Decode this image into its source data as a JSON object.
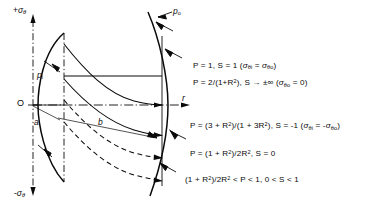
{
  "figure": {
    "type": "engineering-stress-diagram",
    "axes": {
      "y_top_label": "+σθ",
      "y_bottom_label": "-σθ",
      "x_label": "r",
      "origin_label": "O"
    },
    "geometry_labels": {
      "inner_radius": "a",
      "outer_radius": "b",
      "internal_pressure": "p",
      "internal_pressure_sub": "i",
      "external_pressure": "p",
      "external_pressure_sub": "o"
    },
    "annotations": [
      {
        "id": "curve-1",
        "text": "P = 1,  S = 1   (σθi = σθo)",
        "parts": {
          "lead": "P = 1,  S = 1   (",
          "s1": "σ",
          "s1sub": "θi",
          "mid": " = ",
          "s2": "σ",
          "s2sub": "θo",
          "tail": ")"
        }
      },
      {
        "id": "curve-2",
        "text": "P = 2/(1+R²),  S → ±∞   (σθo = 0)",
        "parts": {
          "lead": "P = 2/(1+R",
          "exp": "2",
          "mid": "),  S ",
          "arrow": "→",
          "mid2": " ±∞   (",
          "s1": "σ",
          "s1sub": "θo",
          "tail": " = 0)"
        }
      },
      {
        "id": "curve-3",
        "text": "P = (3+R²)/(1+3R²),  S = -1   (σθi = -σθo)",
        "parts": {
          "lead": "P = (3 + R",
          "exp1": "2",
          "mid": ")/(1 + 3R",
          "exp2": "2",
          "mid2": "),  S = -1   (",
          "s1": "σ",
          "s1sub": "θi",
          "mid3": " = -",
          "s2": "σ",
          "s2sub": "θo",
          "tail": ")"
        }
      },
      {
        "id": "curve-4",
        "text": "P = (1+R²)/2R²,  S = 0",
        "parts": {
          "lead": "P = (1 + R",
          "exp1": "2",
          "mid": ")/2R",
          "exp2": "2",
          "tail": ",  S = 0"
        }
      },
      {
        "id": "curve-5",
        "text": "(1+R²)/2R² < P < 1,  0 < S < 1",
        "parts": {
          "lead": "(1 + R",
          "exp1": "2",
          "mid": ")/2R",
          "exp2": "2",
          "tail": " < P < 1,  0 < S < 1"
        }
      }
    ],
    "colors": {
      "ink": "#0a0a0a",
      "background": "#ffffff"
    }
  }
}
